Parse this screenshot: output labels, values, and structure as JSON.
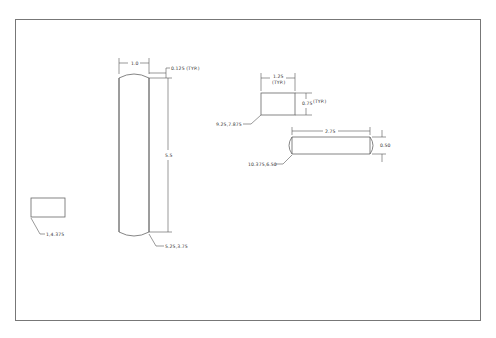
{
  "drawing": {
    "frame": {
      "x": 15,
      "y": 19,
      "width": 465,
      "height": 301
    },
    "colors": {
      "background": "#ffffff",
      "frame": "#777777",
      "lines": "#666666",
      "text": "#333333"
    },
    "parts": [
      {
        "id": "tall-bar",
        "type": "rounded-bar-vertical",
        "dimensions": {
          "width_label": "1.0",
          "corner_label": "0.125 (TYP.)",
          "height_label": "5.5"
        },
        "position_label": "5.25,3.75"
      },
      {
        "id": "small-block",
        "type": "rectangle",
        "dimensions": {
          "width_label": "1.25",
          "width_note": "(TYP.)",
          "height_label": "0.75",
          "height_note": "(TYP.)"
        },
        "position_label": "9.25,7.875"
      },
      {
        "id": "horizontal-bar",
        "type": "rounded-bar-horizontal",
        "dimensions": {
          "width_label": "2.75",
          "height_label": "0.50"
        },
        "position_label": "10.375,6.50"
      },
      {
        "id": "left-block",
        "type": "rectangle",
        "position_label": "1,4.375"
      }
    ]
  }
}
